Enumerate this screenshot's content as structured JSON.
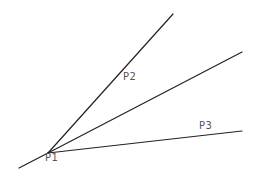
{
  "diagram": {
    "background": "#ffffff",
    "stroke_color": "#222222",
    "label_color": "#555555",
    "stroke_width": 1.2,
    "lines": [
      {
        "name": "line-extension-lower-left",
        "x1": 19,
        "y1": 168,
        "x2": 48,
        "y2": 153
      },
      {
        "name": "line-p1-p2",
        "x1": 48,
        "y1": 153,
        "x2": 173,
        "y2": 14
      },
      {
        "name": "line-middle",
        "x1": 48,
        "y1": 153,
        "x2": 242,
        "y2": 52
      },
      {
        "name": "line-p1-p3",
        "x1": 48,
        "y1": 153,
        "x2": 242,
        "y2": 131
      }
    ],
    "labels": [
      {
        "text": "P1",
        "x": 45,
        "y": 153
      },
      {
        "text": "P2",
        "x": 123,
        "y": 72
      },
      {
        "text": "P3",
        "x": 199,
        "y": 121
      }
    ]
  }
}
